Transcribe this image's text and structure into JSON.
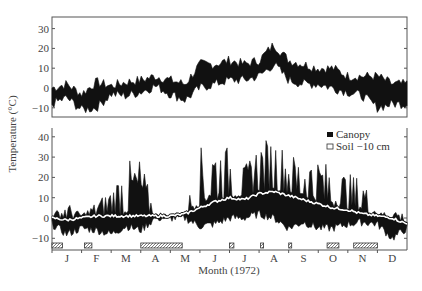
{
  "chart_data": [
    {
      "type": "area",
      "panel": "top",
      "title": "",
      "xlabel": "",
      "ylabel": "Temperature (°C)",
      "ylim": [
        -15,
        35
      ],
      "yticks": [
        30,
        20,
        10,
        0,
        -10
      ],
      "grid": false,
      "description": "Air temperature daily range band (min–max) through the year",
      "x_months": [
        "J",
        "F",
        "M",
        "A",
        "M",
        "J",
        "J",
        "A",
        "S",
        "O",
        "N",
        "D"
      ],
      "series": [
        {
          "name": "Air max",
          "values": [
            0,
            2,
            -3,
            3,
            1,
            3,
            4,
            6,
            4,
            2,
            12,
            12,
            14,
            12,
            14,
            22,
            14,
            12,
            10,
            10,
            6,
            6,
            6,
            2,
            2
          ]
        },
        {
          "name": "Air min",
          "values": [
            -8,
            -5,
            -11,
            -10,
            -3,
            -4,
            -2,
            1,
            -3,
            -6,
            0,
            2,
            4,
            4,
            6,
            12,
            4,
            2,
            2,
            0,
            -2,
            -4,
            -10,
            -8,
            -8
          ]
        }
      ]
    },
    {
      "type": "area",
      "panel": "bottom",
      "title": "",
      "xlabel": "Month (1972)",
      "ylabel": "Temperature (°C)",
      "ylim": [
        -15,
        45
      ],
      "yticks": [
        40,
        30,
        20,
        10,
        0,
        -10
      ],
      "grid": false,
      "legend": {
        "position": "upper right",
        "entries": [
          "Canopy",
          "Soil −10 cm"
        ]
      },
      "x_months": [
        "J",
        "F",
        "M",
        "A",
        "M",
        "J",
        "J",
        "A",
        "S",
        "O",
        "N",
        "D"
      ],
      "series": [
        {
          "name": "Canopy max",
          "values": [
            2,
            8,
            2,
            8,
            15,
            28,
            30,
            2,
            2,
            2,
            35,
            37,
            35,
            25,
            38,
            40,
            32,
            30,
            30,
            25,
            22,
            20,
            2,
            5,
            2
          ]
        },
        {
          "name": "Canopy min",
          "values": [
            -3,
            -8,
            -5,
            -6,
            -8,
            -4,
            -6,
            0,
            0,
            0,
            -4,
            -3,
            0,
            0,
            2,
            0,
            -5,
            -2,
            -5,
            -5,
            -3,
            -2,
            -3,
            -10,
            -5
          ]
        },
        {
          "name": "Soil −10 cm",
          "values": [
            0,
            -1,
            0,
            1,
            1,
            1,
            1,
            1,
            1,
            2,
            5,
            8,
            10,
            9,
            12,
            13,
            11,
            9,
            7,
            5,
            4,
            2,
            1,
            0,
            -3
          ]
        }
      ],
      "snow_cover_bars": [
        {
          "label": "J",
          "start_month": 0.0,
          "end_month": 0.35
        },
        {
          "label": "F",
          "start_month": 1.1,
          "end_month": 1.35
        },
        {
          "label": "A–M",
          "start_month": 3.0,
          "end_month": 4.4
        },
        {
          "label": "J",
          "start_month": 6.0,
          "end_month": 6.15
        },
        {
          "label": "A",
          "start_month": 7.05,
          "end_month": 7.12
        },
        {
          "label": "S",
          "start_month": 8.0,
          "end_month": 8.1
        },
        {
          "label": "O",
          "start_month": 9.3,
          "end_month": 9.7
        },
        {
          "label": "N",
          "start_month": 10.2,
          "end_month": 11.0
        }
      ]
    }
  ],
  "axis": {
    "ylabel": "Temperature (°C)",
    "xlabel": "Month (1972)",
    "months": [
      "J",
      "F",
      "M",
      "A",
      "M",
      "J",
      "J",
      "A",
      "S",
      "O",
      "N",
      "D"
    ],
    "top_yticks": [
      "30",
      "20",
      "10",
      "0",
      "−10"
    ],
    "bottom_yticks": [
      "40",
      "30",
      "20",
      "10",
      "0",
      "−10"
    ]
  },
  "legend": {
    "canopy": "Canopy",
    "soil": "Soil −10 cm"
  }
}
